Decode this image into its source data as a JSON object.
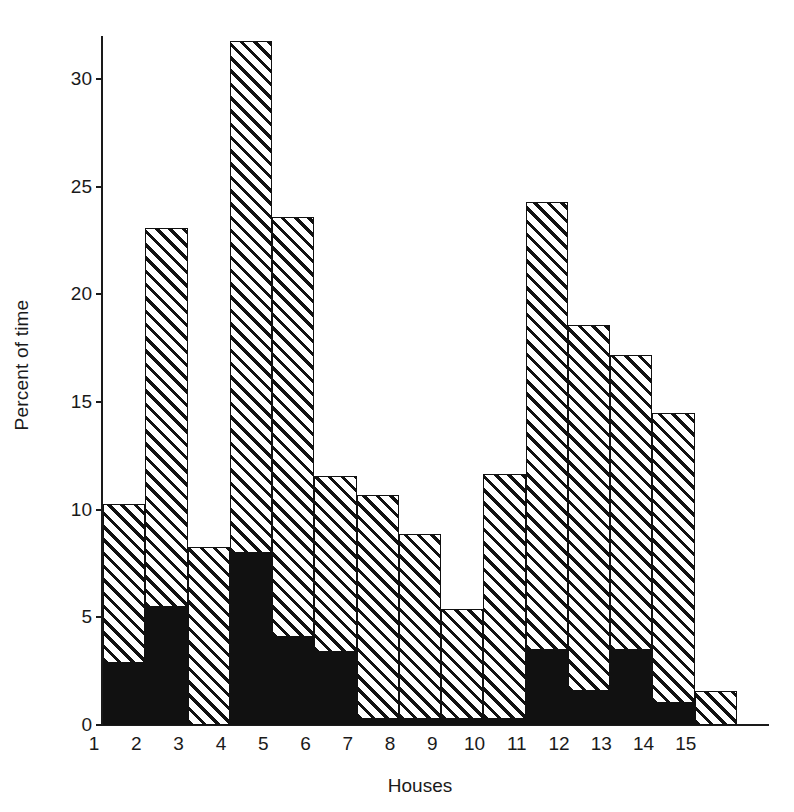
{
  "chart_data": {
    "type": "bar",
    "subtype": "stacked-bar",
    "title": "",
    "xlabel": "Houses",
    "ylabel": "Percent of time",
    "categories": [
      "1",
      "2",
      "3",
      "4",
      "5",
      "6",
      "7",
      "8",
      "9",
      "10",
      "11",
      "12",
      "13",
      "14",
      "15"
    ],
    "ylim": [
      0,
      32
    ],
    "yticks": [
      0,
      5,
      10,
      15,
      20,
      25,
      30
    ],
    "ytick_labels": [
      "0",
      "5",
      "10",
      "15",
      "20",
      "25",
      "30"
    ],
    "grid": false,
    "legend": "none",
    "bar_gap": 0,
    "series": [
      {
        "name": "solid-black-lower",
        "fill": "solid-black",
        "color": "#111111",
        "values": [
          2.9,
          5.5,
          0.0,
          8.0,
          4.1,
          3.4,
          0.3,
          0.3,
          0.3,
          0.3,
          3.5,
          1.6,
          3.5,
          1.0,
          0.0
        ]
      },
      {
        "name": "hatched-upper",
        "fill": "diagonal-hatch",
        "color": "#111111",
        "values": [
          7.3,
          17.5,
          8.2,
          23.7,
          19.4,
          8.1,
          10.3,
          8.5,
          5.0,
          11.3,
          20.7,
          16.9,
          13.6,
          13.4,
          1.5
        ]
      }
    ],
    "totals": [
      10.2,
      23.0,
      8.2,
      31.7,
      23.5,
      11.5,
      10.6,
      8.8,
      5.3,
      11.6,
      24.2,
      18.5,
      17.1,
      14.4,
      1.5
    ]
  }
}
